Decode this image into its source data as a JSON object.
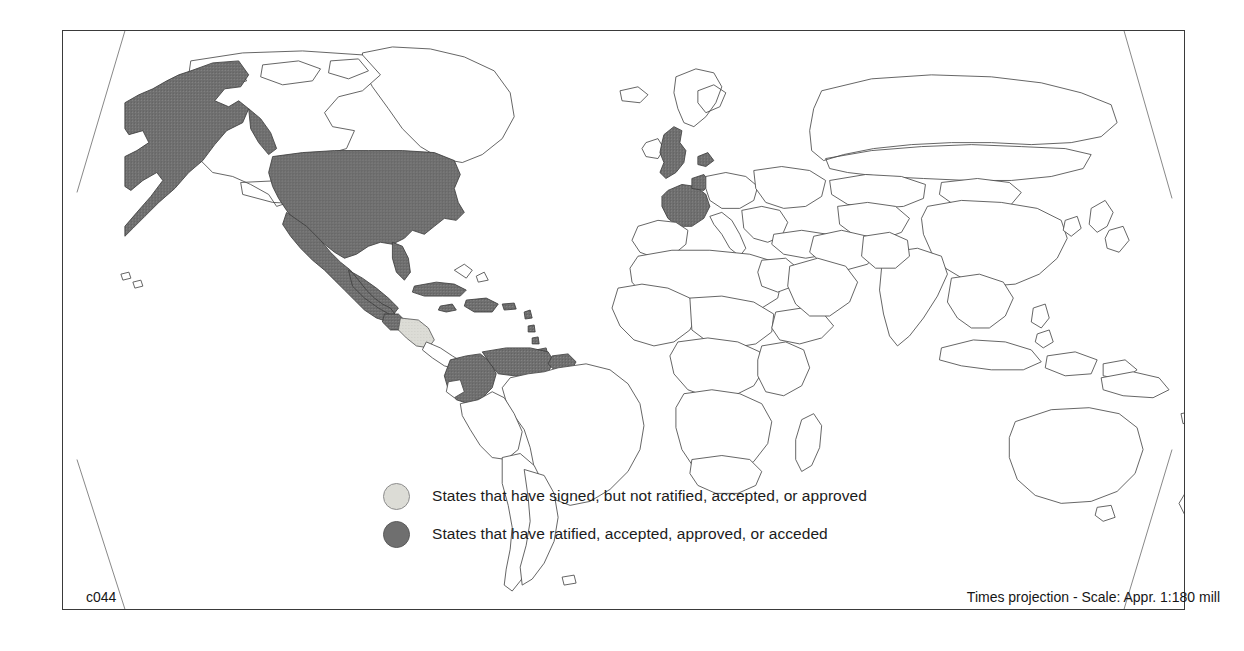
{
  "map": {
    "title": "World map of treaty participation",
    "projection_note": "Times projection - Scale: Appr. 1:180 mill",
    "sheet_code": "c044",
    "colors": {
      "signed_fill": "#dcdcd6",
      "ratified_fill": "#6f6f6f",
      "unshaded_fill": "#ffffff",
      "outline": "#4a4a4a",
      "frame": "#3a3a3a",
      "text": "#161616"
    }
  },
  "legend": {
    "items": [
      {
        "swatch": "signed",
        "label": "States that have signed, but not ratified, accepted, or approved"
      },
      {
        "swatch": "ratified",
        "label": "States that have ratified, accepted, approved, or acceded"
      }
    ]
  },
  "footer": {
    "left": "c044",
    "right": "Times projection - Scale: Appr. 1:180 mill"
  },
  "shaded_regions": {
    "ratified": [
      "United States of America",
      "Alaska",
      "Mexico",
      "Guatemala",
      "Belize",
      "Cuba",
      "Jamaica",
      "Haiti",
      "Dominican Republic",
      "Puerto Rico",
      "Bahamas",
      "Trinidad and Tobago",
      "Colombia",
      "Venezuela",
      "Guyana",
      "United Kingdom",
      "France",
      "Belgium",
      "Netherlands",
      "Denmark"
    ],
    "signed": [
      "Honduras",
      "Nicaragua",
      "El Salvador"
    ]
  }
}
